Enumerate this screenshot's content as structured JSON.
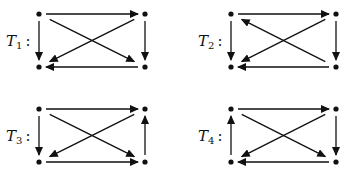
{
  "colors": {
    "ink": "#111111",
    "background": "#ffffff"
  },
  "tournaments": [
    {
      "name": "T1",
      "letter": "T",
      "subscript": "1",
      "label_pos": [
        6,
        46
      ],
      "nodes": {
        "a": [
          39,
          14
        ],
        "b": [
          145,
          14
        ],
        "c": [
          39,
          67
        ],
        "d": [
          145,
          67
        ]
      },
      "edges": [
        [
          "a",
          "b"
        ],
        [
          "a",
          "c"
        ],
        [
          "b",
          "d"
        ],
        [
          "d",
          "c"
        ],
        [
          "a",
          "d"
        ],
        [
          "b",
          "c"
        ]
      ]
    },
    {
      "name": "T2",
      "letter": "T",
      "subscript": "2",
      "label_pos": [
        198,
        46
      ],
      "nodes": {
        "a": [
          231,
          14
        ],
        "b": [
          336,
          14
        ],
        "c": [
          231,
          67
        ],
        "d": [
          336,
          67
        ]
      },
      "edges": [
        [
          "a",
          "b"
        ],
        [
          "a",
          "c"
        ],
        [
          "b",
          "d"
        ],
        [
          "d",
          "c"
        ],
        [
          "d",
          "a"
        ],
        [
          "b",
          "c"
        ]
      ]
    },
    {
      "name": "T3",
      "letter": "T",
      "subscript": "3",
      "label_pos": [
        6,
        141
      ],
      "nodes": {
        "a": [
          39,
          109
        ],
        "b": [
          145,
          109
        ],
        "c": [
          39,
          162
        ],
        "d": [
          145,
          162
        ]
      },
      "edges": [
        [
          "a",
          "b"
        ],
        [
          "a",
          "c"
        ],
        [
          "d",
          "b"
        ],
        [
          "c",
          "d"
        ],
        [
          "a",
          "d"
        ],
        [
          "b",
          "c"
        ]
      ]
    },
    {
      "name": "T4",
      "letter": "T",
      "subscript": "4",
      "label_pos": [
        198,
        141
      ],
      "nodes": {
        "a": [
          231,
          109
        ],
        "b": [
          336,
          109
        ],
        "c": [
          231,
          162
        ],
        "d": [
          336,
          162
        ]
      },
      "edges": [
        [
          "a",
          "b"
        ],
        [
          "c",
          "a"
        ],
        [
          "b",
          "d"
        ],
        [
          "d",
          "c"
        ],
        [
          "a",
          "d"
        ],
        [
          "b",
          "c"
        ]
      ]
    }
  ]
}
